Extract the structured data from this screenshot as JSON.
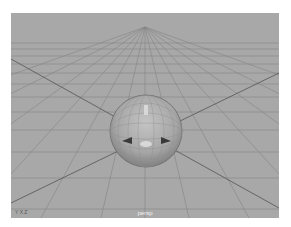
{
  "viewport": {
    "camera_label": "persp",
    "axis_indicator": "Y  X  Z",
    "background": "#a8a8a8",
    "grid_color": "#7c7c7c",
    "object": "sphere"
  }
}
